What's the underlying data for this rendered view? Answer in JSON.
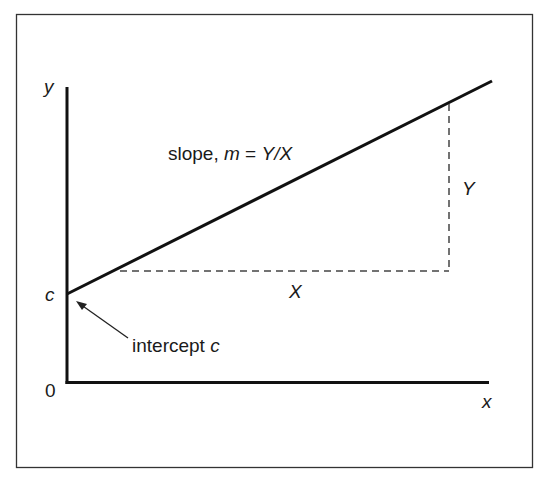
{
  "diagram": {
    "type": "linear-function-graph",
    "frame": {
      "border_color": "#333333"
    },
    "axes": {
      "y_label": "y",
      "x_label": "x",
      "origin_label": "0"
    },
    "line": {
      "description": "straight line y = mx + c",
      "color": "#111111"
    },
    "labels": {
      "intercept_axis_label": "c",
      "slope_prefix": "slope, ",
      "slope_symbol": "m",
      "slope_equals": " = ",
      "slope_formula": "Y/X",
      "rise_label": "Y",
      "run_label": "X",
      "intercept_annotation_prefix": "intercept ",
      "intercept_annotation_symbol": "c"
    },
    "guides": {
      "style": "dashed",
      "color": "#444444"
    }
  }
}
